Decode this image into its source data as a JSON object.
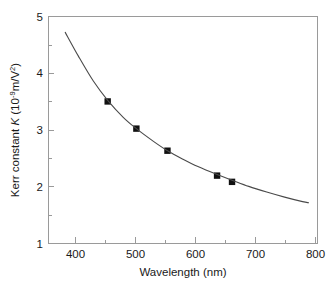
{
  "chart_data": {
    "type": "scatter",
    "title": "",
    "xlabel": "Wavelength (nm)",
    "ylabel_prefix": "Kerr constant ",
    "ylabel_symbol": "K",
    "ylabel_units_open": " (10",
    "ylabel_units_exp": "-9",
    "ylabel_units_close": "m/V",
    "ylabel_units_exp2": "2",
    "ylabel_units_end": ")",
    "ylabel_full": "Kerr constant K (10-9 m/V2)",
    "xlim": [
      350,
      800
    ],
    "ylim": [
      1,
      5
    ],
    "xticks": [
      400,
      500,
      600,
      700,
      800
    ],
    "xtick_labels": [
      "400",
      "500",
      "600",
      "700",
      "800"
    ],
    "xminor_ticks": [
      350,
      450,
      550,
      650,
      750
    ],
    "yticks": [
      1,
      2,
      3,
      4,
      5
    ],
    "ytick_labels": [
      "1",
      "2",
      "3",
      "4",
      "5"
    ],
    "yminor_ticks": [
      1.5,
      2.5,
      3.5,
      4.5
    ],
    "grid": false,
    "legend": false,
    "series": [
      {
        "name": "Kerr constant measurements",
        "marker": "square",
        "marker_color": "#111111",
        "x": [
          449,
          497,
          549,
          632,
          657
        ],
        "y": [
          3.5,
          3.02,
          2.63,
          2.19,
          2.08
        ]
      },
      {
        "name": "fitted dispersion curve",
        "marker": "none",
        "line_color": "#4a4a4a",
        "x": [
          378,
          400,
          425,
          449,
          475,
          497,
          525,
          549,
          575,
          600,
          632,
          657,
          685,
          715,
          745,
          775,
          785
        ],
        "y": [
          4.72,
          4.3,
          3.86,
          3.52,
          3.22,
          3.02,
          2.8,
          2.63,
          2.48,
          2.35,
          2.21,
          2.11,
          2.0,
          1.9,
          1.81,
          1.73,
          1.71
        ]
      }
    ]
  }
}
